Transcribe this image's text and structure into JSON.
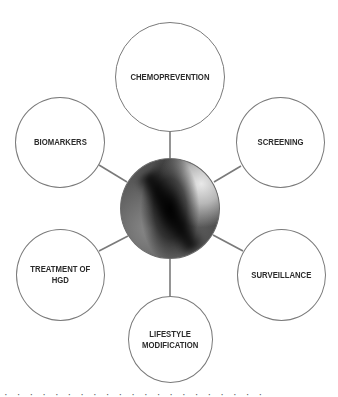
{
  "diagram": {
    "hub": {
      "description": "endoscopic image of Barrett's esophagus (grayscale)"
    },
    "nodes": [
      {
        "id": "chemoprevention",
        "label": "CHEMOPREVENTION"
      },
      {
        "id": "biomarkers",
        "label": "BIOMARKERS"
      },
      {
        "id": "screening",
        "label": "SCREENING"
      },
      {
        "id": "treatment-of-hgd",
        "label": "TREATMENT OF\nHGD"
      },
      {
        "id": "surveillance",
        "label": "SURVEILLANCE"
      },
      {
        "id": "lifestyle-modification",
        "label": "LIFESTYLE\nMODIFICATION"
      }
    ],
    "colors": {
      "node_border": "#7a7a7a",
      "connector": "#7a7a7a",
      "label_text": "#2b2b2b",
      "background": "#ffffff"
    }
  },
  "caption": {
    "text": "(cropped caption text — illegible, only tops of letters visible)"
  }
}
